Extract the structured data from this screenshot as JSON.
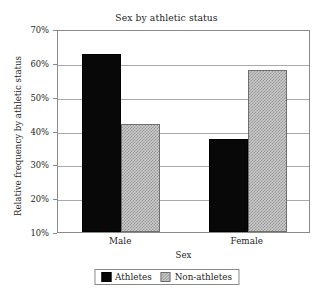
{
  "chart_data": {
    "type": "bar",
    "title": "Sex by athletic status",
    "xlabel": "Sex",
    "ylabel": "Relative frequency by athletic status",
    "categories": [
      "Male",
      "Female"
    ],
    "series": [
      {
        "name": "Athletes",
        "values": [
          62.5,
          37.5
        ],
        "color": "#080808"
      },
      {
        "name": "Non-athletes",
        "values": [
          42.0,
          58.0
        ],
        "color": "#c9c9c9"
      }
    ],
    "ylim": [
      10,
      70
    ],
    "yticks": [
      70,
      60,
      50,
      40,
      30,
      20,
      10
    ],
    "ytick_labels": [
      "70%",
      "60%",
      "50%",
      "40%",
      "30%",
      "20%",
      "10%"
    ],
    "grid": true,
    "grid_axis": "y",
    "legend_position": "bottom-center",
    "value_unit": "percent",
    "frame": true
  },
  "legend": {
    "entries": [
      {
        "label": "Athletes",
        "swatch": "black-solid-swatch"
      },
      {
        "label": "Non-athletes",
        "swatch": "gray-hatched-swatch"
      }
    ]
  }
}
